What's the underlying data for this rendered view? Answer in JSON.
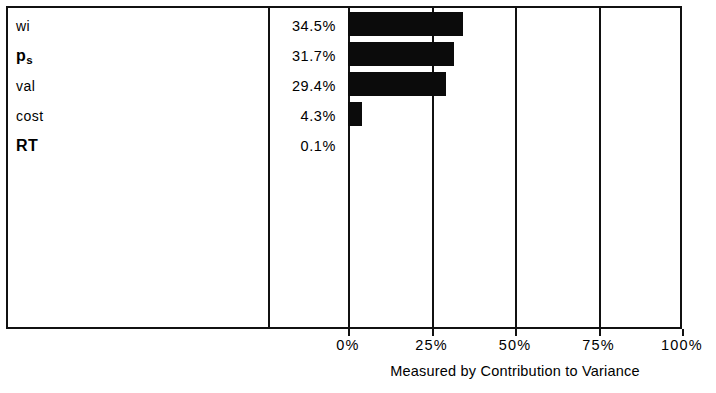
{
  "chart_data": {
    "type": "bar",
    "orientation": "horizontal",
    "title": "",
    "xlabel": "Measured by Contribution to Variance",
    "ylabel": "",
    "categories": [
      "wi",
      "p_s",
      "val",
      "cost",
      "RT"
    ],
    "category_labels": [
      {
        "text": "wi",
        "sub": "",
        "bold": false
      },
      {
        "text": "p",
        "sub": "s",
        "bold": true
      },
      {
        "text": "val",
        "sub": "",
        "bold": false
      },
      {
        "text": "cost",
        "sub": "",
        "bold": false
      },
      {
        "text": "RT",
        "sub": "",
        "bold": true
      }
    ],
    "values": [
      34.5,
      31.7,
      29.4,
      4.3,
      0.1
    ],
    "value_labels": [
      "34.5%",
      "31.7%",
      "29.4%",
      "4.3%",
      "0.1%"
    ],
    "xlim": [
      0,
      100
    ],
    "xticks": [
      0,
      25,
      50,
      75,
      100
    ],
    "xtick_labels": [
      "0%",
      "25%",
      "50%",
      "75%",
      "100%"
    ],
    "grid": true,
    "legend": "none",
    "bar_color": "#0b0b0b",
    "frame_color": "#111111",
    "background": "#ffffff"
  },
  "axis": {
    "caption": "Measured by Contribution to Variance"
  }
}
